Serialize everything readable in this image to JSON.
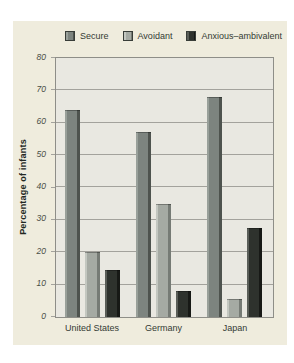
{
  "figure": {
    "panel_bg": "#efecdd",
    "plot_bg": "#e9e8e1",
    "grid_color": "#a3a29c",
    "border_color": "#8e8e88",
    "text_color": "#343b34"
  },
  "chart_data": {
    "type": "bar",
    "title": "",
    "xlabel": "",
    "ylabel": "Percentage of infants",
    "ylim": [
      0,
      80
    ],
    "ytick_step": 10,
    "yticks": [
      0,
      10,
      20,
      30,
      40,
      50,
      60,
      70,
      80
    ],
    "grid": true,
    "legend_position": "top",
    "categories": [
      "United States",
      "Germany",
      "Japan"
    ],
    "series": [
      {
        "name": "Secure",
        "values": [
          64,
          57,
          68
        ],
        "color": "#7d847f",
        "edge_light": "#99a09a",
        "edge_dark": "#4e534e"
      },
      {
        "name": "Avoidant",
        "values": [
          20,
          35,
          5.5
        ],
        "color": "#a5aaa3",
        "edge_light": "#c3c7c0",
        "edge_dark": "#767b75"
      },
      {
        "name": "Anxious–ambivalent",
        "values": [
          14.5,
          8,
          27.5
        ],
        "color": "#2e322d",
        "edge_light": "#5a5e58",
        "edge_dark": "#171916"
      }
    ]
  }
}
